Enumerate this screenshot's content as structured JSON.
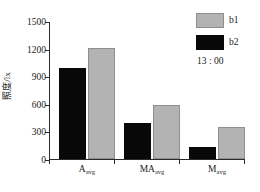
{
  "chart_data": {
    "type": "bar",
    "title": "",
    "xlabel": "",
    "ylabel": "照度/lx",
    "categories": [
      "A",
      "MA",
      "M"
    ],
    "category_subscripts": [
      "avg",
      "avg",
      "avg"
    ],
    "category_labels": [
      "A_avg",
      "MA_avg",
      "M_avg"
    ],
    "series": [
      {
        "name": "b2",
        "color": "#080808",
        "values": [
          990,
          390,
          130
        ]
      },
      {
        "name": "b1",
        "color": "#b3b3b3",
        "values": [
          1210,
          590,
          350
        ]
      }
    ],
    "series_draw_order": [
      "b2",
      "b1"
    ],
    "ylim": [
      0,
      1500
    ],
    "yticks": [
      0,
      300,
      600,
      900,
      1200,
      1500
    ],
    "ytick_labels": [
      "0",
      "300",
      "600",
      "900",
      "1200",
      "1500"
    ],
    "grid": false,
    "legend_position": "top-right",
    "annotation": "13 : 00"
  },
  "legend": {
    "entries": [
      {
        "label": "b1",
        "swatch": "b1"
      },
      {
        "label": "b2",
        "swatch": "b2"
      }
    ],
    "time_label": "13 : 00"
  },
  "axis": {
    "y_label": "照度/lx",
    "y_tick_labels": [
      "1500",
      "1200",
      "900",
      "600",
      "300",
      "0"
    ],
    "x_categories": [
      {
        "base": "A",
        "sub": "avg"
      },
      {
        "base": "MA",
        "sub": "avg"
      },
      {
        "base": "M",
        "sub": "avg"
      }
    ]
  }
}
